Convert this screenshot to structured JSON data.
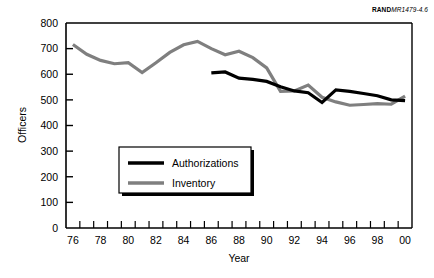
{
  "credit": {
    "brand": "RAND",
    "doc_id": "MR1479-4.6"
  },
  "chart_data": {
    "type": "line",
    "title": "",
    "xlabel": "Year",
    "ylabel": "Officers",
    "xlim": [
      1976,
      2001
    ],
    "ylim": [
      0,
      800
    ],
    "ytick_values": [
      0,
      100,
      200,
      300,
      400,
      500,
      600,
      700,
      800
    ],
    "ytick_labels": [
      "0",
      "100",
      "200",
      "300",
      "400",
      "500",
      "600",
      "700",
      "800"
    ],
    "xtick_labels": [
      "76",
      "78",
      "80",
      "82",
      "84",
      "86",
      "88",
      "90",
      "92",
      "94",
      "96",
      "98",
      "00"
    ],
    "xtick_values": [
      1976,
      1978,
      1980,
      1982,
      1984,
      1986,
      1988,
      1990,
      1992,
      1994,
      1996,
      1998,
      2000
    ],
    "grid": false,
    "legend_position": "lower-left-inside",
    "series": [
      {
        "name": "Authorizations",
        "color": "#000000",
        "width": 3.2,
        "x": [
          1986.5,
          1987.5,
          1988.5,
          1989.5,
          1990.5,
          1991.5,
          1992.5,
          1993.5,
          1994.5,
          1995.5,
          1996.5,
          1997.5,
          1998.5,
          1999.5,
          2000.5
        ],
        "values": [
          605,
          609,
          585,
          580,
          572,
          551,
          535,
          528,
          490,
          539,
          533,
          525,
          516,
          500,
          497
        ]
      },
      {
        "name": "Inventory",
        "color": "#7f7f7f",
        "width": 3.2,
        "x": [
          1976.5,
          1977.5,
          1978.5,
          1979.5,
          1980.5,
          1981.5,
          1982.5,
          1983.5,
          1984.5,
          1985.5,
          1986.5,
          1987.5,
          1988.5,
          1989.5,
          1990.5,
          1991.5,
          1992.5,
          1993.5,
          1994.5,
          1995.5,
          1996.5,
          1997.5,
          1998.5,
          1999.5,
          2000.5
        ],
        "values": [
          716,
          678,
          654,
          641,
          645,
          607,
          645,
          685,
          715,
          728,
          700,
          676,
          690,
          665,
          625,
          533,
          535,
          558,
          510,
          492,
          479,
          482,
          485,
          483,
          515
        ]
      }
    ]
  },
  "legend": {
    "items": [
      {
        "label": "Authorizations",
        "color": "#000000"
      },
      {
        "label": "Inventory",
        "color": "#7f7f7f"
      }
    ]
  }
}
